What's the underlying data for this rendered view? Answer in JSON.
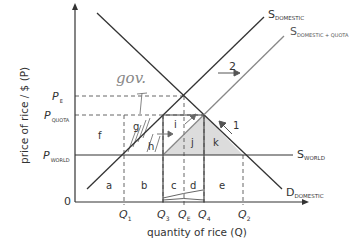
{
  "diagram": {
    "type": "economics-supply-demand-quota",
    "axes": {
      "y_label": "price of rice / $ (P)",
      "x_label": "quantity of rice (Q)",
      "origin": "0"
    },
    "price_labels": [
      {
        "main": "P",
        "sub": "E"
      },
      {
        "main": "P",
        "sub": "QUOTA"
      },
      {
        "main": "P",
        "sub": "WORLD"
      }
    ],
    "quantity_labels": [
      {
        "main": "Q",
        "sub": "1"
      },
      {
        "main": "Q",
        "sub": "3"
      },
      {
        "main": "Q",
        "sub": "E"
      },
      {
        "main": "Q",
        "sub": "4"
      },
      {
        "main": "Q",
        "sub": "2"
      }
    ],
    "curves": {
      "s_domestic": {
        "main": "S",
        "sub": "DOMESTIC"
      },
      "s_domestic_quota": {
        "main": "S",
        "sub": "DOMESTIC + QUOTA"
      },
      "s_world": {
        "main": "S",
        "sub": "WORLD"
      },
      "d_domestic": {
        "main": "D",
        "sub": "DOMESTIC"
      }
    },
    "areas": [
      "a",
      "b",
      "c",
      "d",
      "e",
      "f",
      "g",
      "h",
      "i",
      "j",
      "k"
    ],
    "annotations": {
      "arrow_1": "1",
      "arrow_2": "2",
      "handwritten": "gov."
    },
    "colors": {
      "line": "#333333",
      "quota_line": "#777777",
      "shade": "#d9d9d9",
      "dash": "#555555"
    }
  }
}
